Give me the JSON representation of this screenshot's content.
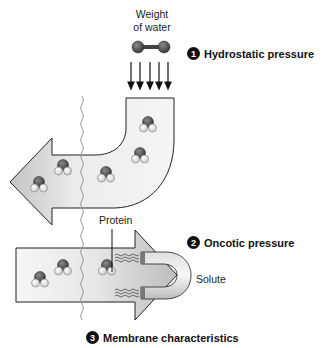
{
  "labels": {
    "weight_line1": "Weight",
    "weight_line2": "of water",
    "protein": "Protein",
    "solute": "Solute"
  },
  "steps": [
    {
      "number": "1",
      "label": "Hydrostatic pressure"
    },
    {
      "number": "2",
      "label": "Oncotic pressure"
    },
    {
      "number": "3",
      "label": "Membrane characteristics"
    }
  ],
  "colors": {
    "arrow_fill_light": "#f2f2f2",
    "arrow_fill_dark": "#c8c8c8",
    "outline": "#222222",
    "badge": "#111111",
    "oxygen": "#555555",
    "hydrogen": "#f4f4f4",
    "membrane": "#9a9a9a"
  }
}
